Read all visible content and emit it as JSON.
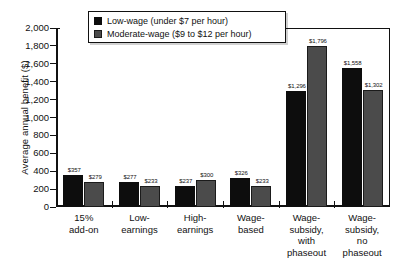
{
  "chart_data": {
    "type": "bar",
    "title": "",
    "xlabel": "",
    "ylabel": "Average annual benefit ($)",
    "ylim": [
      0,
      2000
    ],
    "ytick_step": 200,
    "grid": false,
    "legend_position": "top-center",
    "categories": [
      "15%\nadd-on",
      "Low-\nearnings",
      "High-\nearnings",
      "Wage-\nbased",
      "Wage-\nsubsidy,\nwith\nphaseout",
      "Wage-\nsubsidy,\nno\nphaseout"
    ],
    "category_lines": [
      [
        "15%",
        "add-on"
      ],
      [
        "Low-",
        "earnings"
      ],
      [
        "High-",
        "earnings"
      ],
      [
        "Wage-",
        "based"
      ],
      [
        "Wage-",
        "subsidy,",
        "with",
        "phaseout"
      ],
      [
        "Wage-",
        "subsidy,",
        "no",
        "phaseout"
      ]
    ],
    "ytick_labels": [
      "2,000",
      "1,800",
      "1,600",
      "1,400",
      "1,200",
      "1,000",
      "800",
      "600",
      "400",
      "200",
      "0"
    ],
    "ytick_values": [
      2000,
      1800,
      1600,
      1400,
      1200,
      1000,
      800,
      600,
      400,
      200,
      0
    ],
    "series": [
      {
        "name": "Low-wage (under $7 per hour)",
        "color": "#0d0d0d",
        "values": [
          357,
          277,
          237,
          326,
          1296,
          1558
        ],
        "labels": [
          "$357",
          "$277",
          "$237",
          "$326",
          "$1,296",
          "$1,558"
        ]
      },
      {
        "name": "Moderate-wage ($9 to $12 per hour)",
        "color": "#4b4b4b",
        "values": [
          279,
          233,
          300,
          233,
          1796,
          1302
        ],
        "labels": [
          "$279",
          "$233",
          "$300",
          "$233",
          "$1,796",
          "$1,302"
        ]
      }
    ]
  },
  "legend": {
    "items": [
      {
        "label": "Low-wage (under $7 per hour)",
        "swatch": "low"
      },
      {
        "label": "Moderate-wage ($9 to $12 per hour)",
        "swatch": "mod"
      }
    ]
  },
  "colors": {
    "low_wage": "#0d0d0d",
    "moderate_wage": "#4b4b4b",
    "axis": "#111111",
    "background": "#ffffff"
  }
}
